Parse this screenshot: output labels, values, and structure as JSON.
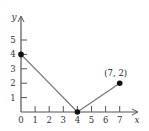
{
  "chart_data": {
    "type": "line",
    "title": "",
    "xlabel": "x",
    "ylabel": "y",
    "xlim": [
      0,
      7.6
    ],
    "ylim": [
      0,
      6
    ],
    "x_ticks": [
      0,
      1,
      2,
      3,
      4,
      5,
      6,
      7
    ],
    "y_ticks": [
      1,
      2,
      3,
      4,
      5
    ],
    "grid": false,
    "series": [
      {
        "name": "piecewise",
        "color": "#777777",
        "x": [
          0,
          4,
          7
        ],
        "y": [
          4,
          0,
          2
        ]
      }
    ],
    "points": [
      {
        "x": 0,
        "y": 4
      },
      {
        "x": 4,
        "y": 0
      },
      {
        "x": 7,
        "y": 2
      }
    ],
    "annotations": [
      {
        "text": "(7, 2)",
        "x": 7,
        "y": 2
      }
    ],
    "origin_label": "0"
  },
  "colors": {
    "axis": "#555555",
    "line": "#777777",
    "point": "#111111"
  }
}
